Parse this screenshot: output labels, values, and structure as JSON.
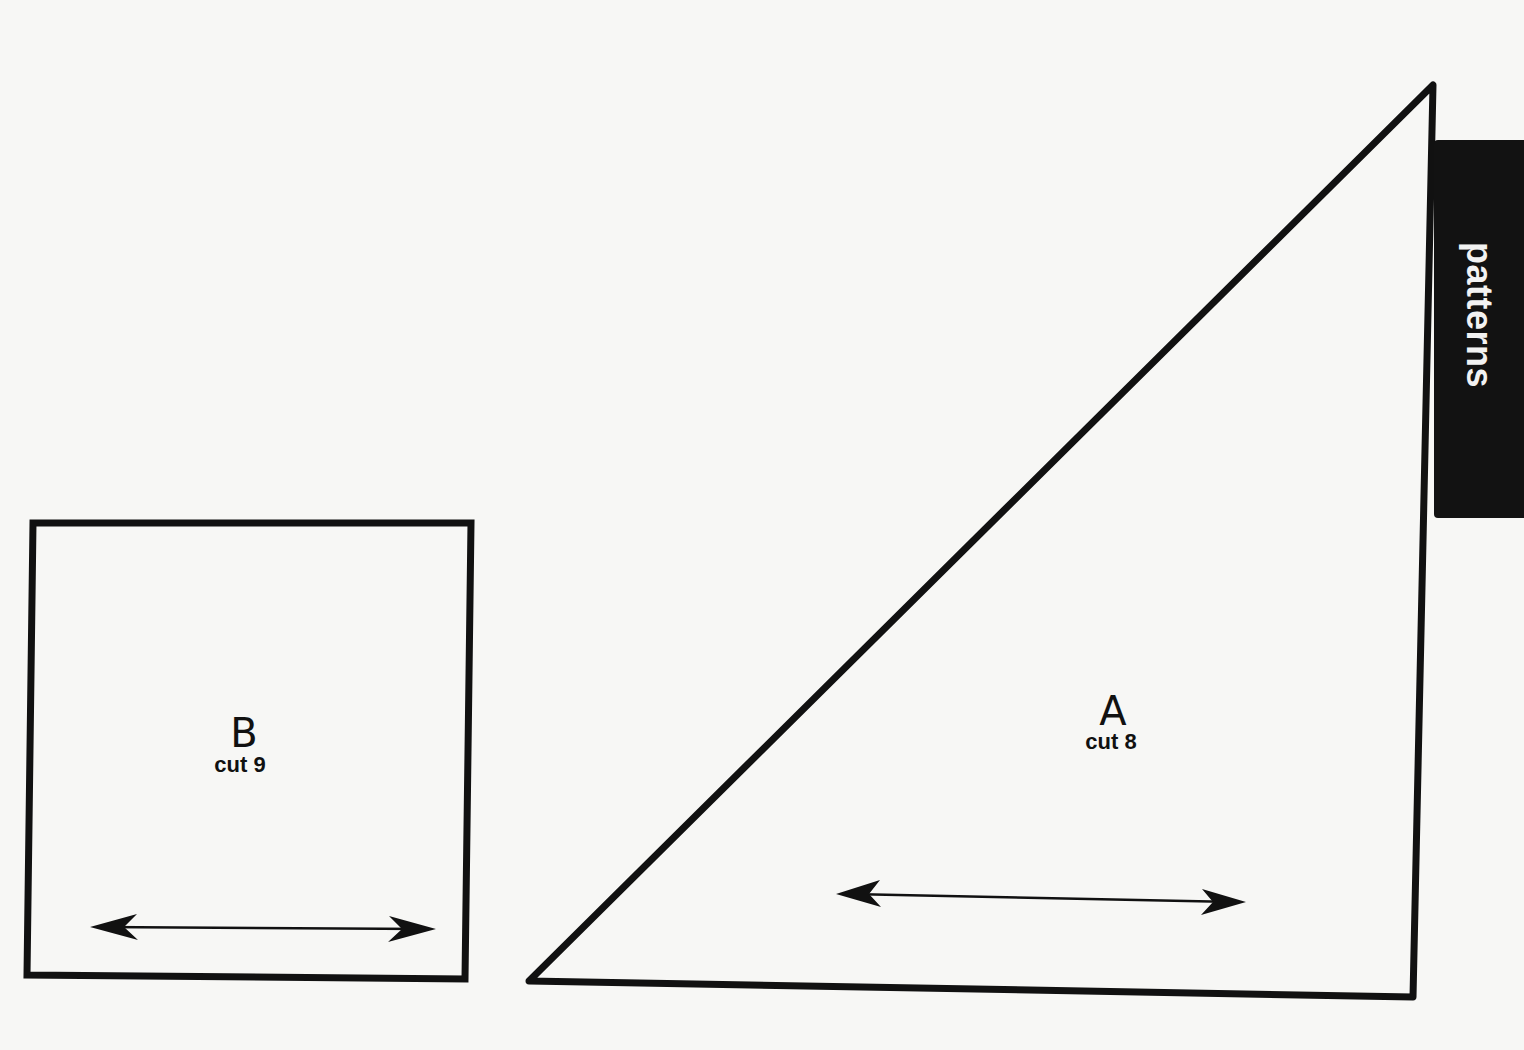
{
  "page": {
    "section_tab": {
      "label": "patterns"
    },
    "pieces": [
      {
        "id": "B",
        "shape": "square",
        "letter": "B",
        "cut_text": "cut 9",
        "grain_arrow": "double-headed horizontal"
      },
      {
        "id": "A",
        "shape": "right-triangle",
        "letter": "A",
        "cut_text": "cut 8",
        "grain_arrow": "double-headed horizontal"
      }
    ],
    "colors": {
      "paper": "#f7f7f5",
      "ink": "#111111",
      "tab_background": "#121212",
      "tab_text": "#f2f2f2"
    }
  }
}
